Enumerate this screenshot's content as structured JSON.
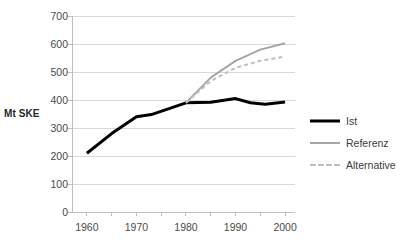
{
  "chart_data": {
    "type": "line",
    "title": "",
    "xlabel": "",
    "ylabel": "Mt SKE",
    "x": [
      1960,
      1970,
      1980,
      1990,
      2000
    ],
    "xlim": [
      1957,
      2002
    ],
    "ylim": [
      0,
      700
    ],
    "ytick_labels": [
      "0",
      "100",
      "200",
      "300",
      "400",
      "500",
      "600",
      "700"
    ],
    "yticks": [
      0,
      100,
      200,
      300,
      400,
      500,
      600,
      700
    ],
    "xtick_labels": [
      "1960",
      "1970",
      "1980",
      "1990",
      "2000"
    ],
    "xticks": [
      1960,
      1970,
      1980,
      1990,
      2000
    ],
    "grid": true,
    "legend_position": "right",
    "series": [
      {
        "name": "Ist",
        "color": "#000000",
        "style": "solid",
        "width": 3,
        "x": [
          1960,
          1965,
          1970,
          1973,
          1980,
          1985,
          1990,
          1993,
          1996,
          2000
        ],
        "values": [
          210,
          280,
          340,
          348,
          390,
          392,
          405,
          390,
          385,
          393
        ]
      },
      {
        "name": "Referenz",
        "color": "#a6a6a6",
        "style": "solid",
        "width": 2,
        "x": [
          1980,
          1985,
          1990,
          1995,
          2000
        ],
        "values": [
          390,
          480,
          540,
          580,
          603
        ]
      },
      {
        "name": "Alternative",
        "color": "#bfbfbf",
        "style": "dashed",
        "width": 2,
        "x": [
          1980,
          1985,
          1990,
          1995,
          2000
        ],
        "values": [
          390,
          468,
          515,
          540,
          555
        ]
      }
    ]
  },
  "legend": {
    "items": [
      {
        "label": "Ist"
      },
      {
        "label": "Referenz"
      },
      {
        "label": "Alternative"
      }
    ]
  },
  "colors": {
    "background": "#ffffff",
    "gridline": "#d9d9d9",
    "axis": "#bfbfbf",
    "text": "#3b3b3b"
  }
}
